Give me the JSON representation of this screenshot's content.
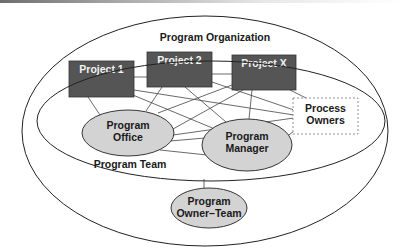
{
  "diagram": {
    "title": "Program Organization",
    "team_label": "Program Team",
    "projects": [
      {
        "label": "Project 1"
      },
      {
        "label": "Project 2"
      },
      {
        "label": "Project X"
      }
    ],
    "process_owners": {
      "line1": "Process",
      "line2": "Owners"
    },
    "program_office": {
      "line1": "Program",
      "line2": "Office"
    },
    "program_manager": {
      "line1": "Program",
      "line2": "Manager"
    },
    "owner_team": {
      "line1": "Program",
      "line2": "Owner–Team"
    },
    "colors": {
      "project_fill": "#555555",
      "ellipse_fill": "#d3d3d3",
      "stroke": "#222222",
      "connector": "#444444",
      "dashed": "#777777"
    }
  }
}
